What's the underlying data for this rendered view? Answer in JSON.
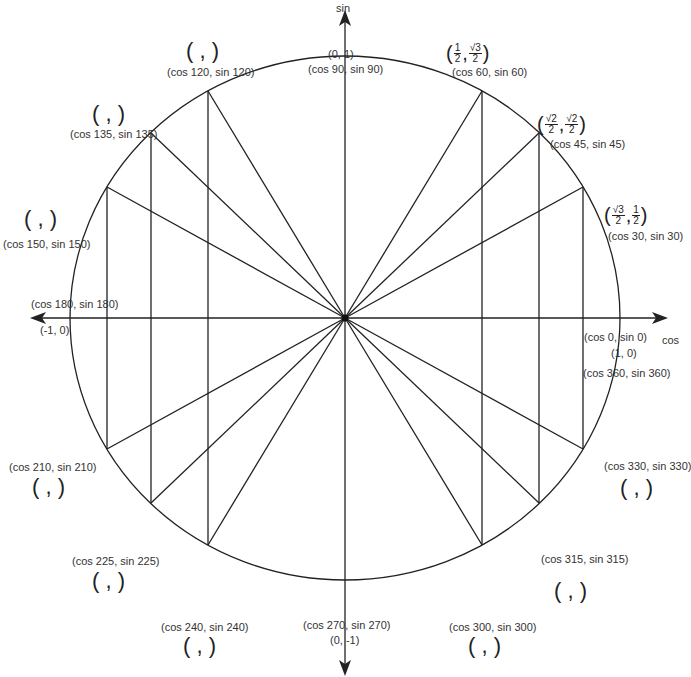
{
  "axes": {
    "x_label": "cos",
    "y_label": "sin"
  },
  "points": [
    {
      "angle": 0,
      "label": "(cos 0, sin 0)",
      "coords": "(1, 0)"
    },
    {
      "angle": 360,
      "label": "(cos 360, sin 360)"
    },
    {
      "angle": 30,
      "label": "(cos 30, sin 30)",
      "coords_num1": "√3",
      "coords_den1": "2",
      "coords_num2": "1",
      "coords_den2": "2"
    },
    {
      "angle": 45,
      "label": "(cos 45, sin 45)",
      "coords_num1": "√2",
      "coords_den1": "2",
      "coords_num2": "√2",
      "coords_den2": "2"
    },
    {
      "angle": 60,
      "label": "(cos 60, sin 60)",
      "coords_num1": "1",
      "coords_den1": "2",
      "coords_num2": "√3",
      "coords_den2": "2"
    },
    {
      "angle": 90,
      "label": "(cos 90, sin 90)",
      "coords": "(0, 1)"
    },
    {
      "angle": 120,
      "label": "(cos 120, sin 120)",
      "blank": "(  ,  )"
    },
    {
      "angle": 135,
      "label": "(cos 135, sin 135)",
      "blank": "(  ,  )"
    },
    {
      "angle": 150,
      "label": "(cos 150, sin 150)",
      "blank": "(  ,  )"
    },
    {
      "angle": 180,
      "label": "(cos 180, sin 180)",
      "coords": "(-1, 0)"
    },
    {
      "angle": 210,
      "label": "(cos 210, sin 210)",
      "blank": "(  ,  )"
    },
    {
      "angle": 225,
      "label": "(cos 225, sin 225)",
      "blank": "(  ,  )"
    },
    {
      "angle": 240,
      "label": "(cos 240, sin 240)",
      "blank": "(  ,  )"
    },
    {
      "angle": 270,
      "label": "(cos 270, sin 270)",
      "coords": "(0, -1)"
    },
    {
      "angle": 300,
      "label": "(cos 300, sin 300)",
      "blank": "(  ,  )"
    },
    {
      "angle": 315,
      "label": "(cos 315, sin 315)",
      "blank": "(  ,  )"
    },
    {
      "angle": 330,
      "label": "(cos 330, sin 330)",
      "blank": "(  ,  )"
    }
  ]
}
